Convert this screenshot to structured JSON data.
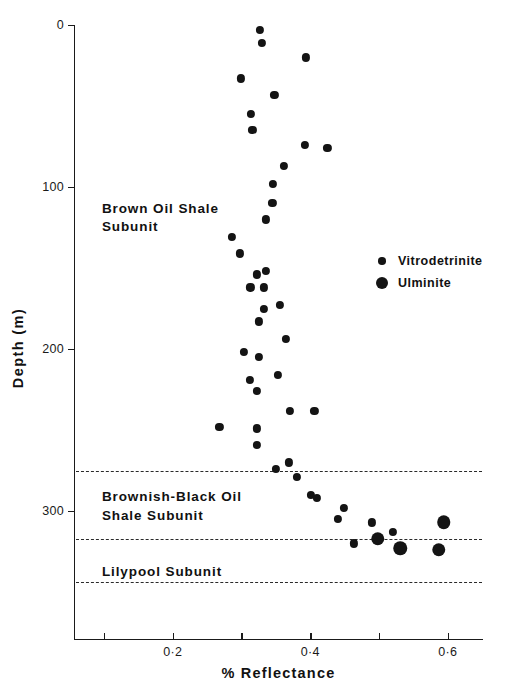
{
  "chart_data": {
    "type": "scatter",
    "title": "",
    "xlabel": "% Reflectance",
    "ylabel": "Depth (m)",
    "xlim": [
      0.055,
      0.6
    ],
    "ylim": [
      0,
      379
    ],
    "y_inverted": true,
    "grid": false,
    "x_ticks": [
      {
        "value": 0.1,
        "label": ""
      },
      {
        "value": 0.2,
        "label": "0·2"
      },
      {
        "value": 0.3,
        "label": ""
      },
      {
        "value": 0.4,
        "label": "0·4"
      },
      {
        "value": 0.5,
        "label": ""
      },
      {
        "value": 0.6,
        "label": "0·6"
      }
    ],
    "y_ticks": [
      {
        "value": 0,
        "label": "0"
      },
      {
        "value": 100,
        "label": "100"
      },
      {
        "value": 200,
        "label": "200"
      },
      {
        "value": 300,
        "label": "300"
      }
    ],
    "legend": {
      "position": "inside-right",
      "entries": [
        {
          "name": "Vitrodetrinite",
          "marker": "small-filled-circle"
        },
        {
          "name": "Ulminite",
          "marker": "large-filled-circle"
        }
      ]
    },
    "annotations": [
      {
        "text": "Brown Oil Shale\nSubunit",
        "x": 0.097,
        "y": 108
      },
      {
        "text": "Brownish-Black Oil\nShale Subunit",
        "x": 0.097,
        "y": 286
      },
      {
        "text": "Lilypool Subunit",
        "x": 0.097,
        "y": 332
      }
    ],
    "boundaries": [
      {
        "depth": 275,
        "style": "dashed"
      },
      {
        "depth": 317,
        "style": "dashed"
      },
      {
        "depth": 344,
        "style": "dashed"
      }
    ],
    "series": [
      {
        "name": "Vitrodetrinite",
        "marker": "small-filled-circle",
        "points": [
          {
            "x": 0.327,
            "y": 3
          },
          {
            "x": 0.33,
            "y": 11
          },
          {
            "x": 0.394,
            "y": 20
          },
          {
            "x": 0.299,
            "y": 33
          },
          {
            "x": 0.348,
            "y": 43
          },
          {
            "x": 0.314,
            "y": 55
          },
          {
            "x": 0.316,
            "y": 65
          },
          {
            "x": 0.392,
            "y": 74
          },
          {
            "x": 0.425,
            "y": 76
          },
          {
            "x": 0.362,
            "y": 87
          },
          {
            "x": 0.346,
            "y": 98
          },
          {
            "x": 0.345,
            "y": 110
          },
          {
            "x": 0.335,
            "y": 120
          },
          {
            "x": 0.286,
            "y": 131
          },
          {
            "x": 0.298,
            "y": 141
          },
          {
            "x": 0.323,
            "y": 154
          },
          {
            "x": 0.335,
            "y": 152
          },
          {
            "x": 0.313,
            "y": 162
          },
          {
            "x": 0.333,
            "y": 162
          },
          {
            "x": 0.333,
            "y": 175
          },
          {
            "x": 0.356,
            "y": 173
          },
          {
            "x": 0.325,
            "y": 183
          },
          {
            "x": 0.365,
            "y": 194
          },
          {
            "x": 0.303,
            "y": 202
          },
          {
            "x": 0.325,
            "y": 205
          },
          {
            "x": 0.353,
            "y": 216
          },
          {
            "x": 0.312,
            "y": 219
          },
          {
            "x": 0.322,
            "y": 226
          },
          {
            "x": 0.371,
            "y": 238
          },
          {
            "x": 0.406,
            "y": 238
          },
          {
            "x": 0.268,
            "y": 248
          },
          {
            "x": 0.323,
            "y": 249
          },
          {
            "x": 0.323,
            "y": 259
          },
          {
            "x": 0.35,
            "y": 274
          },
          {
            "x": 0.369,
            "y": 270
          },
          {
            "x": 0.381,
            "y": 279
          },
          {
            "x": 0.401,
            "y": 290
          },
          {
            "x": 0.41,
            "y": 292
          },
          {
            "x": 0.44,
            "y": 305
          },
          {
            "x": 0.449,
            "y": 298
          },
          {
            "x": 0.464,
            "y": 320
          },
          {
            "x": 0.49,
            "y": 307
          },
          {
            "x": 0.52,
            "y": 313
          }
        ]
      },
      {
        "name": "Ulminite",
        "marker": "large-filled-circle",
        "points": [
          {
            "x": 0.498,
            "y": 317
          },
          {
            "x": 0.531,
            "y": 323
          },
          {
            "x": 0.594,
            "y": 307
          },
          {
            "x": 0.587,
            "y": 324
          }
        ]
      }
    ]
  }
}
